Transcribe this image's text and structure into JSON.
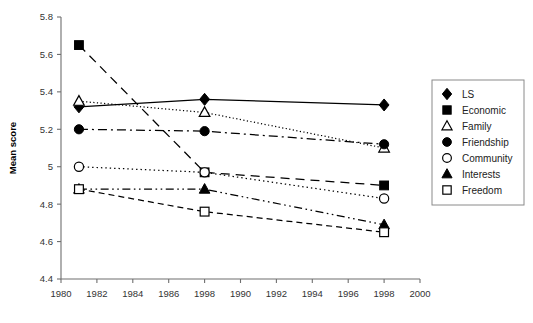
{
  "chart_data": {
    "type": "line",
    "title": "",
    "subtitle": "",
    "xlabel": "",
    "ylabel": "Mean score",
    "xlim": [
      1980,
      2000
    ],
    "ylim": [
      4.4,
      5.8
    ],
    "grid": false,
    "legend_position": "right-outside",
    "x": [
      1981,
      1988,
      1998
    ],
    "xtick_labels": [
      "1980",
      "1982",
      "1984",
      "1986",
      "1998",
      "1990",
      "1992",
      "1994",
      "1996",
      "1998",
      "2000"
    ],
    "xtick_values": [
      1980,
      1982,
      1984,
      1986,
      1988,
      1990,
      1992,
      1994,
      1996,
      1998,
      2000
    ],
    "ytick_labels": [
      "4.4",
      "4.6",
      "4.8",
      "5",
      "5.2",
      "5.4",
      "5.6",
      "5.8"
    ],
    "ytick_values": [
      4.4,
      4.6,
      4.8,
      5.0,
      5.2,
      5.4,
      5.6,
      5.8
    ],
    "series": [
      {
        "name": "LS",
        "marker": "filled-diamond",
        "line_style": "solid",
        "values": [
          5.32,
          5.36,
          5.33
        ]
      },
      {
        "name": "Economic",
        "marker": "filled-square",
        "line_style": "long-dash",
        "values": [
          5.65,
          4.97,
          4.9
        ]
      },
      {
        "name": "Family",
        "marker": "open-triangle",
        "line_style": "fine-dot",
        "values": [
          5.35,
          5.29,
          5.1
        ]
      },
      {
        "name": "Friendship",
        "marker": "filled-circle",
        "line_style": "dash-dot",
        "values": [
          5.2,
          5.19,
          5.12
        ]
      },
      {
        "name": "Community",
        "marker": "open-circle",
        "line_style": "dot",
        "values": [
          5.0,
          4.97,
          4.83
        ]
      },
      {
        "name": "Interests",
        "marker": "filled-triangle",
        "line_style": "dash-dot-dot",
        "values": [
          4.88,
          4.88,
          4.69
        ]
      },
      {
        "name": "Freedom",
        "marker": "open-square",
        "line_style": "dash",
        "values": [
          4.88,
          4.76,
          4.65
        ]
      }
    ]
  },
  "legend": {
    "items": [
      {
        "label": "LS",
        "marker": "filled-diamond"
      },
      {
        "label": "Economic",
        "marker": "filled-square"
      },
      {
        "label": "Family",
        "marker": "open-triangle"
      },
      {
        "label": "Friendship",
        "marker": "filled-circle"
      },
      {
        "label": "Community",
        "marker": "open-circle"
      },
      {
        "label": "Interests",
        "marker": "filled-triangle"
      },
      {
        "label": "Freedom",
        "marker": "open-square"
      }
    ]
  },
  "colors": {
    "ink": "#000000",
    "axis": "#6f6f6f",
    "text": "#222222",
    "background": "#ffffff"
  }
}
